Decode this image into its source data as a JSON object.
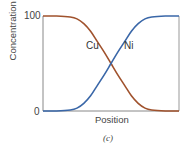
{
  "chart_data": {
    "type": "line",
    "title": "",
    "caption": "(c)",
    "xlabel": "Position",
    "ylabel": "Concentration of Ni, Cu",
    "yticks": [
      "0",
      "100"
    ],
    "ylim": [
      0,
      100
    ],
    "grid": false,
    "legend": "inline labels",
    "x": [
      0,
      0.1,
      0.2,
      0.25,
      0.3,
      0.35,
      0.4,
      0.45,
      0.5,
      0.55,
      0.6,
      0.65,
      0.7,
      0.75,
      0.8,
      0.9,
      1.0
    ],
    "series": [
      {
        "name": "Cu",
        "color": "#a0522d",
        "values": [
          100,
          100,
          99,
          97,
          92,
          84,
          73,
          62,
          50,
          38,
          27,
          16,
          8,
          3,
          1,
          0,
          0
        ]
      },
      {
        "name": "Ni",
        "color": "#3a67a8",
        "values": [
          0,
          0,
          1,
          3,
          8,
          16,
          27,
          38,
          50,
          62,
          73,
          84,
          92,
          97,
          99,
          100,
          100
        ]
      }
    ],
    "annotations": [
      {
        "text": "Cu",
        "near": "descending curve"
      },
      {
        "text": "Ni",
        "near": "ascending curve"
      }
    ]
  },
  "labels": {
    "ylabel": "Concentration of Ni, Cu",
    "xlabel": "Position",
    "tick_top": "100",
    "tick_bottom": "0",
    "cu": "Cu",
    "ni": "Ni",
    "caption": "(c)"
  }
}
